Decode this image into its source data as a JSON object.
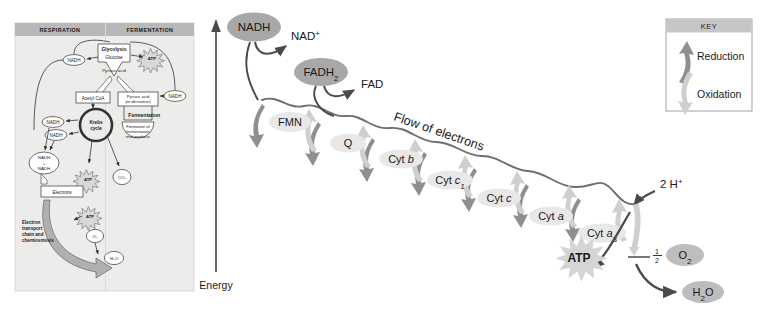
{
  "figure": {
    "energy_axis_label": "Energy",
    "flow_label": "Flow of electrons"
  },
  "inset": {
    "columns": [
      {
        "header": "RESPIRATION"
      },
      {
        "header": "FERMENTATION"
      }
    ],
    "nodes": [
      {
        "id": "glycolysis",
        "label": "Glycolysis"
      },
      {
        "id": "glucose",
        "label": "Glucose"
      },
      {
        "id": "pyruvic-acid",
        "label": "Pyruvic acid"
      },
      {
        "id": "acetyl-coa",
        "label": "Acetyl CoA"
      },
      {
        "id": "krebs-cycle",
        "label": "Krebs cycle"
      },
      {
        "id": "pyruvic-derivative",
        "label": "Pyruvic acid (or derivative)"
      },
      {
        "id": "fermentation",
        "label": "Fermentation"
      },
      {
        "id": "fermentation-products",
        "label": "Formation of fermentation end-products"
      },
      {
        "id": "electrons",
        "label": "Electrons"
      },
      {
        "id": "etc-chemiosmosis",
        "label": "Electron transport chain and chemiosmosis"
      },
      {
        "id": "nadh-sum",
        "label": "NADH + NADH"
      }
    ],
    "nadh_labels": [
      "NADH",
      "NADH",
      "NADH",
      "NADH",
      "NADH"
    ],
    "atp_labels": [
      "ATP",
      "ATP",
      "ATP"
    ],
    "co2_labels": [
      "CO2",
      "CO2"
    ],
    "o2_label": "O2",
    "h2o_label": "H2O"
  },
  "key": {
    "title": "KEY",
    "entries": [
      {
        "label": "Reduction",
        "arrow": "down-arrow-icon",
        "color": "#8f8f8f"
      },
      {
        "label": "Oxidation",
        "arrow": "up-arrow-icon",
        "color": "#cfcfcf"
      }
    ]
  },
  "carriers": [
    {
      "label": "FMN",
      "x": 290,
      "y": 122
    },
    {
      "label": "Q",
      "x": 348,
      "y": 143
    },
    {
      "label": "Cyt b",
      "x": 400,
      "y": 159
    },
    {
      "label": "Cyt c1",
      "x": 448,
      "y": 180
    },
    {
      "label": "Cyt c",
      "x": 497,
      "y": 198
    },
    {
      "label": "Cyt a",
      "x": 550,
      "y": 216
    },
    {
      "label": "Cyt a3",
      "x": 600,
      "y": 233
    }
  ],
  "donors": [
    {
      "label": "NADH",
      "x": 254,
      "y": 27
    },
    {
      "label": "FADH2",
      "x": 321,
      "y": 72
    }
  ],
  "products": [
    {
      "label": "NAD+",
      "x": 287,
      "y": 37
    },
    {
      "label": "FAD",
      "x": 363,
      "y": 85
    },
    {
      "label": "2 H+",
      "x": 662,
      "y": 185
    },
    {
      "label": "1/2",
      "x": 655,
      "y": 256
    },
    {
      "label": "O2",
      "x": 683,
      "y": 255
    },
    {
      "label": "H2O",
      "x": 699,
      "y": 292
    },
    {
      "label": "ATP",
      "x": 581,
      "y": 272
    }
  ],
  "colors": {
    "donor_fill": "#a8a8a8",
    "carrier_fill": "#e8e8e8",
    "reduction_arrow": "#8f8f8f",
    "oxidation_arrow": "#cfcfcf",
    "chain_line": "#6e6e6e",
    "panel_header": "#b8b8b8",
    "panel_bg": "#ececeb",
    "text": "#1a1a1a"
  }
}
